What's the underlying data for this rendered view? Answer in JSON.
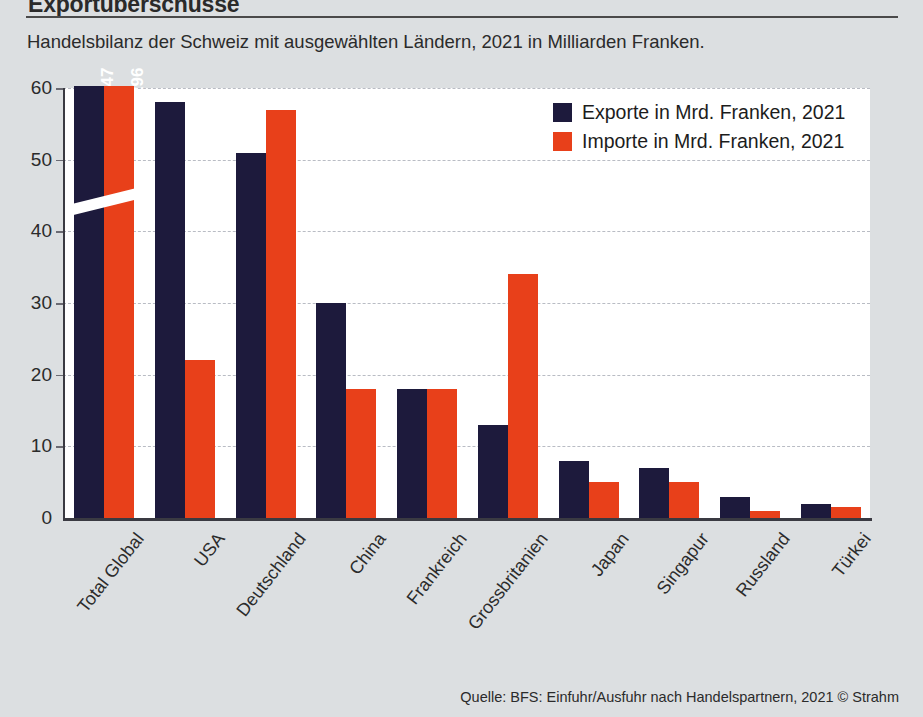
{
  "header": {
    "title": "Exportüberschüsse",
    "subtitle": "Handelsbilanz der Schweiz mit ausgewählten Ländern, 2021 in Milliarden Franken."
  },
  "legend": {
    "position": "top-right",
    "items": [
      {
        "label": "Exporte in Mrd. Franken, 2021",
        "color": "#1d1a3c",
        "swatch_icon": "square-swatch-icon"
      },
      {
        "label": "Importe in Mrd. Franken, 2021",
        "color": "#e8401a",
        "swatch_icon": "square-swatch-icon"
      }
    ]
  },
  "footer": {
    "source": "Quelle: BFS: Einfuhr/Ausfuhr nach Handelspartnern, 2021  © Strahm"
  },
  "chart_data": {
    "type": "bar",
    "title": "Exportüberschüsse",
    "subtitle": "Handelsbilanz der Schweiz mit ausgewählten Ländern, 2021 in Milliarden Franken.",
    "xlabel": "",
    "ylabel": "",
    "ylim": [
      0,
      60
    ],
    "yticks": [
      0,
      10,
      20,
      30,
      40,
      50,
      60
    ],
    "ytick_labels": [
      "0",
      "10",
      "20",
      "30",
      "40",
      "50",
      "60"
    ],
    "grid": true,
    "grid_style": "dashed-horizontal",
    "axis_break": {
      "present": true,
      "applies_to": "Total Global",
      "note": "Balken abgeschnitten, Werte als Datenbeschriftung"
    },
    "categories": [
      "Total Global",
      "USA",
      "Deutschland",
      "China",
      "Frankreich",
      "Grossbritanien",
      "Japan",
      "Singapur",
      "Russland",
      "Türkei"
    ],
    "series": [
      {
        "name": "Exporte in Mrd. Franken, 2021",
        "color": "#1d1a3c",
        "values": [
          347,
          58,
          51,
          30,
          18,
          13,
          8,
          7,
          3,
          2
        ],
        "data_labels": [
          "347",
          "",
          "",
          "",
          "",
          "",
          "",
          "",
          "",
          ""
        ]
      },
      {
        "name": "Importe in Mrd. Franken, 2021",
        "color": "#e8401a",
        "values": [
          296,
          22,
          57,
          18,
          18,
          34,
          5,
          5,
          1,
          1.5
        ],
        "data_labels": [
          "296",
          "",
          "",
          "",
          "",
          "",
          "",
          "",
          "",
          ""
        ]
      }
    ]
  },
  "colors": {
    "background": "#dcdfe1",
    "plot_background": "#ffffff",
    "export_bar": "#1d1a3c",
    "import_bar": "#e8401a",
    "axis": "#3a3a42",
    "grid": "#b9bcc4",
    "text": "#2b2b2b"
  }
}
